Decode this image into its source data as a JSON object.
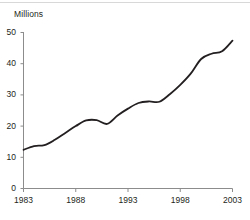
{
  "chart_data": {
    "type": "line",
    "title": "",
    "subtitle": "",
    "xlabel": "",
    "ylabel": "Millions",
    "xlim": [
      1983,
      2003
    ],
    "ylim": [
      0,
      50
    ],
    "grid": false,
    "legend": null,
    "y_ticks": [
      "0",
      "10",
      "20",
      "30",
      "40",
      "50"
    ],
    "y_tick_values": [
      0,
      10,
      20,
      30,
      40,
      50
    ],
    "x_ticks": [
      "1983",
      "1988",
      "1993",
      "1998",
      "2003"
    ],
    "x_tick_values": [
      1983,
      1988,
      1993,
      1998,
      2003
    ],
    "line_color": "#231f20",
    "axis_color": "#8c8c8c",
    "x": [
      1983,
      1984,
      1985,
      1986,
      1987,
      1988,
      1989,
      1990,
      1991,
      1992,
      1993,
      1994,
      1995,
      1996,
      1997,
      1998,
      1999,
      2000,
      2001,
      2002,
      2003
    ],
    "series": [
      {
        "name": "Millions",
        "values": [
          12.4,
          13.6,
          13.9,
          15.6,
          17.8,
          20.0,
          21.8,
          21.9,
          20.7,
          23.4,
          25.6,
          27.4,
          27.9,
          27.8,
          30.2,
          33.2,
          36.8,
          41.5,
          43.2,
          44.0,
          47.4
        ]
      }
    ]
  },
  "axis_title": {
    "label": "Millions"
  }
}
